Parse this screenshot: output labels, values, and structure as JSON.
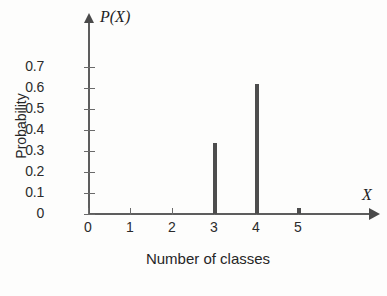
{
  "chart_data": {
    "type": "bar",
    "title": "",
    "subtitle": "",
    "xlabel": "Number of classes",
    "ylabel": "Probability",
    "x_axis_symbol": "X",
    "y_axis_symbol": "P(X)",
    "categories": [
      "0",
      "1",
      "2",
      "3",
      "4",
      "5"
    ],
    "x": [
      0,
      1,
      2,
      3,
      4,
      5
    ],
    "values": [
      0,
      0,
      0,
      0.34,
      0.62,
      0.03
    ],
    "xlim": [
      0,
      5.6
    ],
    "ylim": [
      0,
      0.75
    ],
    "y_ticks": [
      0,
      0.1,
      0.2,
      0.3,
      0.4,
      0.5,
      0.6,
      0.7
    ],
    "y_tick_labels": [
      "0",
      "0.1",
      "0.2",
      "0.3",
      "0.4",
      "0.5",
      "0.6",
      "0.7"
    ],
    "x_ticks": [
      0,
      1,
      2,
      3,
      4,
      5
    ],
    "x_tick_labels": [
      "0",
      "1",
      "2",
      "3",
      "4",
      "5"
    ],
    "grid": false,
    "legend": null,
    "legend_position": "none",
    "series": [
      {
        "name": "Probability",
        "values": [
          0,
          0,
          0,
          0.34,
          0.62,
          0.03
        ],
        "color": "#4d4d4d"
      }
    ],
    "annotations": []
  },
  "colors": {
    "background": "#fdfdfc",
    "axis": "#5d5d5d",
    "tick": "#6a6a6a",
    "spike": "#4d4d4d",
    "text": "#262626"
  }
}
